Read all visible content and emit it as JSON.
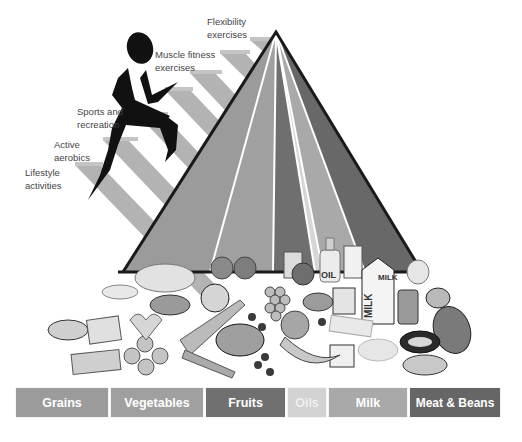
{
  "activity_labels": [
    {
      "id": "flexibility",
      "line1": "Flexibility",
      "line2": "exercises"
    },
    {
      "id": "muscle",
      "line1": "Muscle fitness",
      "line2": "exercises"
    },
    {
      "id": "sports",
      "line1": "Sports and",
      "line2": "recreation"
    },
    {
      "id": "aerobics",
      "line1": "Active",
      "line2": "aerobics"
    },
    {
      "id": "lifestyle",
      "line1": "Lifestyle",
      "line2": "activities"
    }
  ],
  "food_groups": [
    {
      "name": "Grains",
      "color": "#9b9b9b",
      "text_color": "#ffffff"
    },
    {
      "name": "Vegetables",
      "color": "#a0a0a0",
      "text_color": "#ffffff"
    },
    {
      "name": "Fruits",
      "color": "#707070",
      "text_color": "#ffffff"
    },
    {
      "name": "Oils",
      "color": "#d2d2d2",
      "text_color": "#f2f2f2"
    },
    {
      "name": "Milk",
      "color": "#a9a9a9",
      "text_color": "#ffffff"
    },
    {
      "name": "Meat & Beans",
      "color": "#666666",
      "text_color": "#ffffff"
    }
  ],
  "food_item_labels": {
    "oil_bottle": "OIL",
    "milk_carton": "MILK",
    "milk_carton_side": "MILK"
  },
  "colors": {
    "stairs": "#b0b0b0",
    "runner": "#111111",
    "pyramid_outline": "#1a1a1a"
  }
}
